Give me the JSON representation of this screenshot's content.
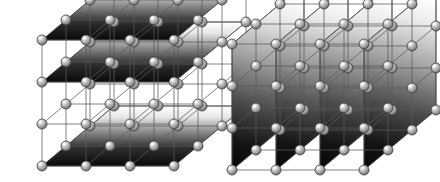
{
  "figure": {
    "background_color": "#ffffff",
    "width": 440,
    "height": 182,
    "atom_color_light": "#f2f2f2",
    "atom_color_mid": "#9a9a9a",
    "atom_color_dark": "#4a4a4a",
    "atom_outline_color": "#3c3c3c",
    "bond_color": "#5a5a5a",
    "plane_color_light": "#ffffff",
    "plane_color_mid": "#9e9e9e",
    "plane_color_dark": "#0d0d0d"
  },
  "panels": [
    {
      "id": "left-lattice",
      "name": "horizontal-planes-lattice",
      "label": "",
      "plane_orientation": "horizontal",
      "plane_count": 3,
      "grid": {
        "nx": 4,
        "ny": 4,
        "nz": 4
      },
      "origin": {
        "x": 42,
        "y": 166
      },
      "vec_a": {
        "x": 44,
        "y": 0
      },
      "vec_b": {
        "x": 24,
        "y": -20
      },
      "vec_c": {
        "x": 0,
        "y": -42
      },
      "shaded_layers": [
        0,
        2,
        3
      ],
      "atom_radius": 5.0
    },
    {
      "id": "right-lattice",
      "name": "vertical-planes-lattice",
      "label": "",
      "plane_orientation": "vertical",
      "plane_count": 4,
      "grid": {
        "nx": 4,
        "ny": 4,
        "nz": 4
      },
      "origin": {
        "x": 232,
        "y": 170
      },
      "vec_a": {
        "x": 44,
        "y": 0
      },
      "vec_b": {
        "x": 24,
        "y": -20
      },
      "vec_c": {
        "x": 0,
        "y": -42
      },
      "shaded_columns": [
        0,
        1,
        2,
        3
      ],
      "atom_radius": 5.0
    }
  ],
  "chart_data": {
    "type": "diagram",
    "panels": [
      {
        "name": "left",
        "plane_orientation": "horizontal",
        "shaded_plane_count": 3,
        "atoms_per_edge": 4
      },
      {
        "name": "right",
        "plane_orientation": "vertical",
        "shaded_plane_count": 4,
        "atoms_per_edge": 4
      }
    ]
  }
}
